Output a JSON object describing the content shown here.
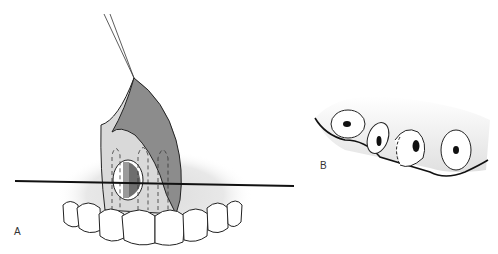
{
  "figure": {
    "panels": [
      {
        "id": "A",
        "label": "A",
        "description": "Frontal view of maxillary anterior teeth with gingival flap raised by suture, showing bony window and cross-section line"
      },
      {
        "id": "B",
        "label": "B",
        "description": "Cross-section view showing tooth roots in alveolar bone with dashed outline"
      }
    ],
    "colors": {
      "flap_dark": "#8a8a8a",
      "flap_light": "#d9d9d9",
      "shadow": "#e6e6e6",
      "outline": "#1a1a1a",
      "tooth": "#ffffff"
    }
  }
}
